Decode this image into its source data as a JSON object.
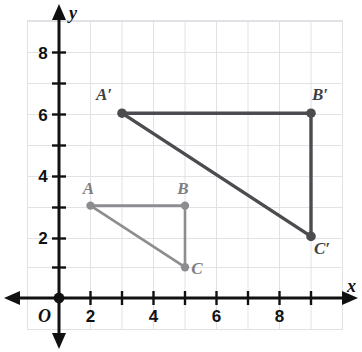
{
  "chart_data": {
    "type": "scatter",
    "title": "",
    "xlabel": "x",
    "ylabel": "y",
    "origin_label": "O",
    "grid": true,
    "xlim": [
      -0.95,
      9.6
    ],
    "ylim": [
      -0.8,
      9.6
    ],
    "x_tick_step": 1,
    "y_tick_step": 1,
    "x_tick_labels": [
      "2",
      "4",
      "6",
      "8"
    ],
    "x_tick_label_values": [
      2,
      4,
      6,
      8
    ],
    "y_tick_labels": [
      "2",
      "4",
      "6",
      "8"
    ],
    "y_tick_label_values": [
      2,
      4,
      6,
      8
    ],
    "series": [
      {
        "name": "Triangle ABC",
        "role": "pre-image",
        "color": "#8d8d90",
        "closed": true,
        "points": [
          {
            "label": "A",
            "x": 1,
            "y": 3,
            "label_dx": -2,
            "label_dy": -12
          },
          {
            "label": "B",
            "x": 4,
            "y": 3,
            "label_dx": -2,
            "label_dy": -12
          },
          {
            "label": "C",
            "x": 4,
            "y": 1,
            "label_dx": 12,
            "label_dy": 7
          }
        ]
      },
      {
        "name": "Triangle A'B'C'",
        "role": "image",
        "color": "#4c4c50",
        "closed": true,
        "points": [
          {
            "label": "A′",
            "x": 2,
            "y": 6,
            "label_dx": -18,
            "label_dy": -13
          },
          {
            "label": "B′",
            "x": 8,
            "y": 6,
            "label_dx": 9,
            "label_dy": -13
          },
          {
            "label": "C′",
            "x": 8,
            "y": 2,
            "label_dx": 11,
            "label_dy": 18
          }
        ]
      }
    ]
  },
  "axes": {
    "x_axis_name": "x",
    "y_axis_name": "y",
    "origin_label": "O"
  },
  "labels": {
    "A": "A",
    "B": "B",
    "C": "C",
    "A_prime": "A′",
    "B_prime": "B′",
    "C_prime": "C′",
    "tick_2": "2",
    "tick_4": "4",
    "tick_6": "6",
    "tick_8": "8",
    "y_tick_2": "2",
    "y_tick_4": "4",
    "y_tick_6": "6",
    "y_tick_8": "8"
  },
  "colors": {
    "pre_image": "#8d8d90",
    "image": "#4c4c50",
    "axis": "#111111",
    "grid": "#e2e2e6",
    "background": "#ffffff"
  }
}
